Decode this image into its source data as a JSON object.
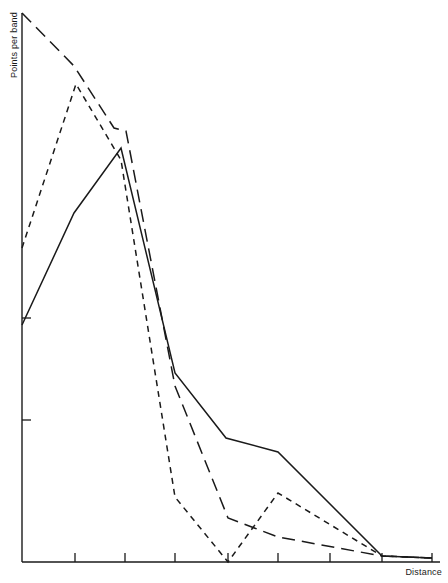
{
  "figure": {
    "width": 448,
    "height": 583,
    "background": "#ffffff",
    "ink_color": "#1a1a1a"
  },
  "axes": {
    "y_label": "Points per band",
    "x_label": "Distance",
    "x_ticks_count": 8,
    "y_ticks_count": 2,
    "grid": false,
    "frame": "left-and-bottom-spines"
  },
  "chart_data": {
    "type": "line",
    "title": "",
    "subtitle": "",
    "xlabel": "Distance",
    "ylabel": "Points per band",
    "xlim": [
      0,
      8
    ],
    "ylim": [
      0,
      100
    ],
    "grid": false,
    "legend": "none",
    "axis_tick_labels": {
      "x": [
        "",
        "",
        "",
        "",
        "",
        "",
        "",
        ""
      ],
      "y": [
        "",
        ""
      ]
    },
    "series": [
      {
        "name": "solid",
        "style": "solid",
        "color": "#1a1a1a",
        "x": [
          0,
          1.02,
          1.94,
          2.99,
          4.0,
          5.0,
          7.05,
          8.0
        ],
        "y": [
          50.2,
          70.1,
          82.0,
          35.1,
          23.6,
          20.2,
          0.0,
          0.0
        ]
      },
      {
        "name": "long-dash",
        "style": "long-dash",
        "color": "#1a1a1a",
        "x": [
          0,
          1.02,
          1.94,
          2.04,
          2.99,
          4.0,
          5.0,
          7.05,
          8.0
        ],
        "y": [
          100.0,
          90.6,
          86.2,
          85.5,
          33.3,
          9.8,
          6.6,
          0.0,
          0.0
        ]
      },
      {
        "name": "short-dash",
        "style": "short-dash",
        "color": "#1a1a1a",
        "x": [
          0,
          1.06,
          1.94,
          2.99,
          4.0,
          5.0,
          7.05,
          8.0
        ],
        "y": [
          61.4,
          87.3,
          79.8,
          13.4,
          0.0,
          12.6,
          0.0,
          0.0
        ]
      }
    ]
  },
  "geometry": {
    "note": "pixel polylines traced from the source raster",
    "origin_px": {
      "x": 22,
      "y": 562
    },
    "y_axis_top_px": 13,
    "x_axis_right_px": 440,
    "x_tick_px": [
      22,
      75,
      125,
      175,
      228,
      278,
      330,
      382,
      432
    ],
    "y_tick_px": [
      318,
      420
    ],
    "polylines": {
      "solid": "22,325 74,213 121,148 175,373 226,438 278,452 382,556 432,558",
      "long_dash": "22,13 74,66 114,128 126,131 175,386 228,518 278,537 382,556 432,558",
      "short_dash": "22,248 76,84 121,160 175,497 228,562 278,493 382,556 432,558"
    }
  }
}
